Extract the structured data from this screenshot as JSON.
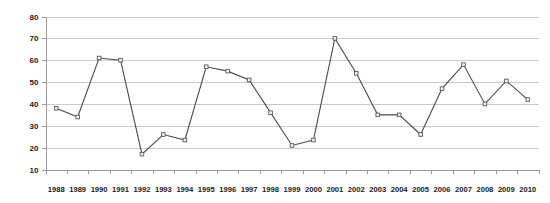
{
  "chart_data": {
    "type": "line",
    "title": "",
    "subtitle": "",
    "xlabel": "",
    "ylabel": "",
    "categories": [
      "1988",
      "1989",
      "1990",
      "1991",
      "1992",
      "1993",
      "1994",
      "1995",
      "1996",
      "1997",
      "1998",
      "1999",
      "2000",
      "2001",
      "2002",
      "2003",
      "2004",
      "2005",
      "2006",
      "2007",
      "2008",
      "2009",
      "2010"
    ],
    "values": [
      38,
      34,
      61,
      60,
      17,
      26,
      23.5,
      57,
      55,
      51,
      36,
      21,
      23.5,
      70,
      54,
      35,
      35,
      26,
      47,
      58,
      40,
      50.5,
      42
    ],
    "series": [
      {
        "name": "Series 1",
        "values": [
          38,
          34,
          61,
          60,
          17,
          26,
          23.5,
          57,
          55,
          51,
          36,
          21,
          23.5,
          70,
          54,
          35,
          35,
          26,
          47,
          58,
          40,
          50.5,
          42
        ]
      }
    ],
    "ylim": [
      10,
      80
    ],
    "yticks": [
      10,
      20,
      30,
      40,
      50,
      60,
      70,
      80
    ],
    "ytick_labels": [
      "10",
      "20",
      "30",
      "40",
      "50",
      "60",
      "70",
      "80"
    ],
    "xtick_labels": [
      "1988",
      "1989",
      "1990",
      "1991",
      "1992",
      "1993",
      "1994",
      "1995",
      "1996",
      "1997",
      "1998",
      "1999",
      "2000",
      "2001",
      "2002",
      "2003",
      "2004",
      "2005",
      "2006",
      "2007",
      "2008",
      "2009",
      "2010"
    ],
    "grid": true,
    "grid_axis": "y",
    "legend": false,
    "legend_position": "none",
    "marker": "square",
    "annotations": []
  },
  "style": {
    "background_color": "#ffffff",
    "line_color": "#4a4a4a",
    "marker_fill": "#f2f2f2",
    "marker_stroke": "#5b5b5b",
    "gridline_color": "#c9c9c9",
    "axis_color": "#9a9a9a",
    "text_color": "#1a1a1a"
  }
}
